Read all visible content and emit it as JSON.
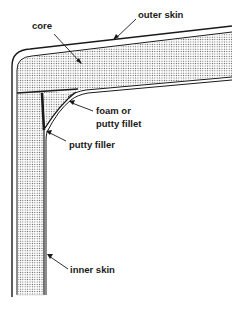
{
  "diagram": {
    "type": "sandwich-panel-corner-cross-section",
    "labels": {
      "outer_skin": "outer skin",
      "core": "core",
      "foam_fillet_line1": "foam or",
      "foam_fillet_line2": "putty fillet",
      "putty_filler": "putty filler",
      "inner_skin": "inner skin"
    },
    "colors": {
      "line": "#1a1a1a",
      "core_dots": "#555555",
      "background": "#ffffff"
    }
  }
}
